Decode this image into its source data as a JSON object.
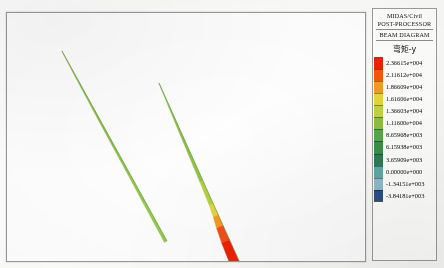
{
  "window": {
    "title": "MIDAS/Civil POST-PROCESSOR - BEAM DIAGRAM"
  },
  "legend": {
    "program_name": "MIDAS/Civil",
    "module_name": "POST-PROCESSOR",
    "diagram_type": "BEAM DIAGRAM",
    "quantity_label": "弯矩-y",
    "entries": [
      {
        "value": "2.36615e+004",
        "color": "#ee2200"
      },
      {
        "value": "2.11612e+004",
        "color": "#f45a08"
      },
      {
        "value": "1.86609e+004",
        "color": "#f59b1e"
      },
      {
        "value": "1.61606e+004",
        "color": "#e9d63a"
      },
      {
        "value": "1.36603e+004",
        "color": "#c3d43c"
      },
      {
        "value": "1.11600e+004",
        "color": "#8fc03f"
      },
      {
        "value": "8.65968e+003",
        "color": "#57a94a"
      },
      {
        "value": "6.15938e+003",
        "color": "#3c8f49"
      },
      {
        "value": "3.65909e+003",
        "color": "#2f7b52"
      },
      {
        "value": "0.00000e+000",
        "color": "#5fa9a6"
      },
      {
        "value": "-1.34151e+003",
        "color": "#8fb8cc"
      },
      {
        "value": "-3.84181e+003",
        "color": "#2c4f86"
      }
    ]
  },
  "chart_data": {
    "type": "line",
    "title": "BEAM DIAGRAM",
    "subtitle": "弯矩-y",
    "xlabel": "",
    "ylabel": "",
    "grid": false,
    "legend_position": "right",
    "colorbar": {
      "label": "弯矩-y",
      "ticks": [
        23661.5,
        21161.2,
        18660.9,
        16160.6,
        13660.3,
        11160.0,
        8659.68,
        6159.38,
        3659.09,
        0.0,
        -1341.51,
        -3841.81
      ],
      "tick_labels": [
        "2.36615e+004",
        "2.11612e+004",
        "1.86609e+004",
        "1.61606e+004",
        "1.36603e+004",
        "1.11600e+004",
        "8.65968e+003",
        "6.15938e+003",
        "3.65909e+003",
        "0.00000e+000",
        "-1.34151e+003",
        "-3.84181e+003"
      ],
      "vmin": -3841.81,
      "vmax": 23661.5
    },
    "series": [
      {
        "name": "beam-left",
        "description": "Left inclined beam member, moment diagram shaded along member axis",
        "start_px": [
          55,
          38
        ],
        "end_px": [
          160,
          228
        ],
        "stations": [
          {
            "t": 0.0,
            "moment": 500,
            "color": "#9ec24a",
            "offset_px": 0.3
          },
          {
            "t": 0.1,
            "moment": 1800,
            "color": "#9ec24a",
            "offset_px": 0.8
          },
          {
            "t": 0.2,
            "moment": 2900,
            "color": "#8fc03f",
            "offset_px": 1.2
          },
          {
            "t": 0.35,
            "moment": 4200,
            "color": "#8fc03f",
            "offset_px": 1.6
          },
          {
            "t": 0.5,
            "moment": 5400,
            "color": "#8cc03f",
            "offset_px": 1.9
          },
          {
            "t": 0.65,
            "moment": 6600,
            "color": "#8fc43f",
            "offset_px": 2.2
          },
          {
            "t": 0.8,
            "moment": 7900,
            "color": "#93c841",
            "offset_px": 2.6
          },
          {
            "t": 1.0,
            "moment": 9200,
            "color": "#97cc45",
            "offset_px": 3.0
          }
        ]
      },
      {
        "name": "beam-right",
        "description": "Right inclined beam member, large positive moment band near base",
        "start_px": [
          152,
          70
        ],
        "end_px": [
          232,
          248
        ],
        "stations": [
          {
            "t": 0.0,
            "moment": 400,
            "color": "#9ec24a",
            "offset_px": 0.3
          },
          {
            "t": 0.12,
            "moment": 2200,
            "color": "#97c845",
            "offset_px": 1.0
          },
          {
            "t": 0.25,
            "moment": 4000,
            "color": "#8fc03f",
            "offset_px": 1.8
          },
          {
            "t": 0.4,
            "moment": 6300,
            "color": "#8fc03f",
            "offset_px": 2.6
          },
          {
            "t": 0.55,
            "moment": 8600,
            "color": "#93c63f",
            "offset_px": 3.4
          },
          {
            "t": 0.68,
            "moment": 11200,
            "color": "#b7d03c",
            "offset_px": 4.4
          },
          {
            "t": 0.74,
            "moment": 14500,
            "color": "#e4d63a",
            "offset_px": 5.5
          },
          {
            "t": 0.8,
            "moment": 18600,
            "color": "#f59b1e",
            "offset_px": 7.0
          },
          {
            "t": 0.88,
            "moment": 21200,
            "color": "#f3501a",
            "offset_px": 8.5
          },
          {
            "t": 1.0,
            "moment": 23661,
            "color": "#ee2200",
            "offset_px": 9.5
          }
        ]
      }
    ]
  }
}
